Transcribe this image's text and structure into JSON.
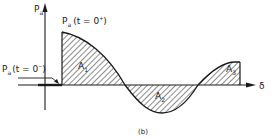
{
  "figure": {
    "caption": "(b)",
    "y_axis_label": {
      "base": "P",
      "sub": "a"
    },
    "x_axis_label": "δ",
    "initial_label": {
      "base": "P",
      "sub": "a",
      "paren": "(t = 0",
      "sup": "+",
      "close": ")"
    },
    "pre_label": {
      "base": "P",
      "sub": "a",
      "paren": "(t = 0",
      "sup": "−",
      "close": ")"
    },
    "areas": [
      {
        "base": "A",
        "sub": "1",
        "sign": "positive"
      },
      {
        "base": "A",
        "sub": "2",
        "sign": "negative"
      },
      {
        "base": "A",
        "sub": "3",
        "sign": "positive"
      }
    ],
    "colors": {
      "ink": "#1a1a1a",
      "background": "#ffffff"
    }
  }
}
